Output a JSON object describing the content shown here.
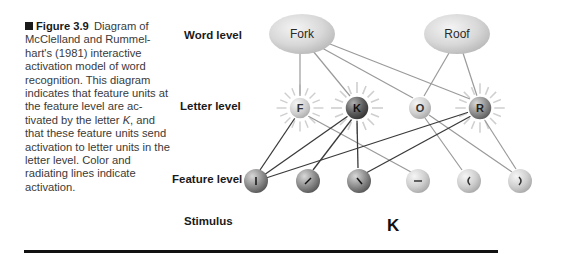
{
  "caption": {
    "figure_label": "Figure 3.9",
    "text_before_italic": "Diagram of McClelland and Rummel-hart's (1981) interactive activation model of word recognition. This diagram indicates that feature units at the feature level are ac-tivated by the letter ",
    "italic": "K",
    "text_after_italic": ", and that these feature units send activation to letter units in the letter level. Color and radiating lines indicate activation."
  },
  "levels": {
    "word": "Word level",
    "letter": "Letter level",
    "feature": "Feature level",
    "stimulus": "Stimulus"
  },
  "word_units": [
    {
      "label": "Fork"
    },
    {
      "label": "Roof"
    }
  ],
  "letter_units": [
    {
      "label": "F",
      "activated": true
    },
    {
      "label": "K",
      "activated": true
    },
    {
      "label": "O",
      "activated": false
    },
    {
      "label": "R",
      "activated": true
    }
  ],
  "feature_units": [
    {
      "glyph": "|",
      "name": "vertical-line",
      "activated": true
    },
    {
      "glyph": "/",
      "name": "forward-diagonal",
      "activated": true
    },
    {
      "glyph": "\\",
      "name": "back-diagonal",
      "activated": true
    },
    {
      "glyph": "—",
      "name": "horizontal-line",
      "activated": false
    },
    {
      "glyph": "(",
      "name": "left-curve",
      "activated": false
    },
    {
      "glyph": ")",
      "name": "right-curve",
      "activated": false
    }
  ],
  "connections": {
    "word_to_letter": [
      [
        "Fork",
        "F"
      ],
      [
        "Fork",
        "K"
      ],
      [
        "Fork",
        "O"
      ],
      [
        "Fork",
        "R"
      ],
      [
        "Roof",
        "O"
      ],
      [
        "Roof",
        "R"
      ]
    ],
    "letter_to_feature_active": [
      [
        "F",
        "|"
      ],
      [
        "K",
        "|"
      ],
      [
        "K",
        "/"
      ],
      [
        "K",
        "\\"
      ],
      [
        "R",
        "|"
      ],
      [
        "R",
        "\\"
      ]
    ],
    "letter_to_feature_inactive": [
      [
        "F",
        "—"
      ],
      [
        "O",
        "("
      ],
      [
        "O",
        ")"
      ],
      [
        "R",
        ")"
      ]
    ]
  },
  "stimulus": "K",
  "colors": {
    "active_line": "#3a3a3a",
    "inactive_line": "#9a9a9a",
    "rays": "#c8c8c8",
    "rule": "#111111"
  }
}
